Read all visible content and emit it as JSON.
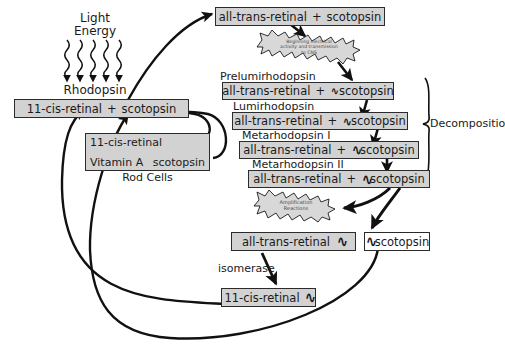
{
  "diagram": {
    "colors": {
      "box_fill": "#d2d2d2",
      "box_fill_white": "#ffffff",
      "box_border": "#2b2b2b",
      "burst_fill": "#d8d8d8",
      "line": "#1a1a1a",
      "text": "#1a1a1a"
    }
  },
  "light": {
    "line1": "Light",
    "line2": "Energy",
    "ray_count": 5
  },
  "rhodopsin": {
    "label": "Rhodopsin",
    "left": "11-cis-retinal",
    "plus": "+",
    "right": "scotopsin"
  },
  "rod_cells": {
    "caption": "Rod Cells",
    "top": "11-cis-retinal",
    "source": "Vitamin A",
    "partner": "scotopsin"
  },
  "top_product": {
    "left": "all-trans-retinal",
    "plus": "+",
    "right": "scotopsin"
  },
  "bursts": [
    {
      "name": "cns-burst",
      "line1": "Beginning electrical",
      "line2": "activity and transmission",
      "line3": "to CNS"
    },
    {
      "name": "amplification-burst",
      "line1": "Amplification",
      "line2": "Reactions",
      "line3": ""
    }
  ],
  "cascade": {
    "brace_label": "Decomposition",
    "steps": [
      {
        "name": "prelumirhodopsin",
        "label": "Prelumirhodopsin",
        "left": "all-trans-retinal",
        "plus": "+",
        "right": "scotopsin",
        "split": 1
      },
      {
        "name": "lumirhodopsin",
        "label": "Lumirhodopsin",
        "left": "all-trans-retinal",
        "plus": "+",
        "right": "scotopsin",
        "split": 2
      },
      {
        "name": "metarhodopsin-i",
        "label": "Metarhodopsin I",
        "left": "all-trans-retinal",
        "plus": "+",
        "right": "scotopsin",
        "split": 3
      },
      {
        "name": "metarhodopsin-ii",
        "label": "Metarhodopsin II",
        "left": "all-trans-retinal",
        "plus": "+",
        "right": "scotopsin",
        "split": 4
      }
    ]
  },
  "separated": {
    "retinal": "all-trans-retinal",
    "scotopsin": "scotopsin"
  },
  "isomerase": {
    "label": "isomerase",
    "product": "11-cis-retinal"
  }
}
